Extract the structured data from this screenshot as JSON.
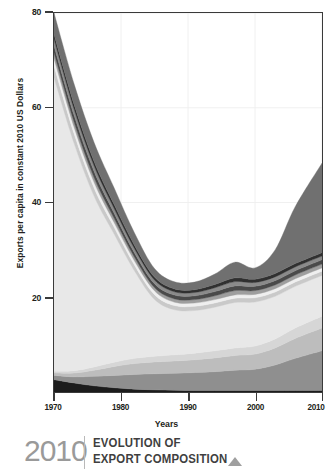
{
  "axes": {
    "y_title": "Exports per capita in constant 2010 US Dollars",
    "x_title": "Years",
    "y_ticks": [
      "80",
      "60",
      "40",
      "20"
    ],
    "x_ticks": [
      "1970",
      "1980",
      "1990",
      "2000",
      "2010"
    ]
  },
  "caption": {
    "year": "2010",
    "line1": "EVOLUTION OF",
    "line2": "EXPORT COMPOSITION",
    "marker": "triangle-up-icon"
  },
  "colors": {
    "frame": "#3a3a3a",
    "grid": "#f0f0f0",
    "text": "#231f20",
    "caption_year": "#9a9a9a",
    "caption_text": "#3f3f3f",
    "marker": "#9f9f9f"
  },
  "chart_data": {
    "type": "area",
    "stacked": true,
    "title": "",
    "xlabel": "Years",
    "ylabel": "Exports per capita in constant 2010 US Dollars",
    "xlim": [
      1970,
      2010
    ],
    "ylim": [
      0,
      80
    ],
    "yticks": [
      20,
      40,
      60,
      80
    ],
    "xticks": [
      1970,
      1980,
      1990,
      2000,
      2010
    ],
    "grid": true,
    "legend": "none",
    "x": [
      1970,
      1973,
      1976,
      1979,
      1982,
      1985,
      1988,
      1991,
      1994,
      1997,
      2000,
      2003,
      2006,
      2010
    ],
    "series": [
      {
        "name": "layer-1-bottom",
        "color": "#1c1c1c",
        "values": [
          2.6,
          1.9,
          1.3,
          0.9,
          0.6,
          0.45,
          0.35,
          0.3,
          0.3,
          0.3,
          0.3,
          0.3,
          0.3,
          0.3
        ]
      },
      {
        "name": "layer-2",
        "color": "#8f8f8f",
        "values": [
          0.9,
          1.3,
          2.0,
          2.6,
          3.1,
          3.4,
          3.6,
          3.8,
          4.0,
          4.3,
          4.5,
          5.4,
          6.8,
          8.4
        ]
      },
      {
        "name": "layer-3",
        "color": "#bdbdbd",
        "values": [
          0.5,
          0.8,
          1.3,
          1.9,
          2.3,
          2.5,
          2.6,
          2.7,
          2.9,
          3.1,
          3.2,
          3.6,
          4.2,
          4.8
        ]
      },
      {
        "name": "layer-4",
        "color": "#d6d6d6",
        "values": [
          0.4,
          0.5,
          0.7,
          0.9,
          1.1,
          1.2,
          1.3,
          1.4,
          1.5,
          1.6,
          1.7,
          1.9,
          2.2,
          2.5
        ]
      },
      {
        "name": "layer-5-dominant",
        "color": "#e8e8e8",
        "values": [
          62.0,
          48.0,
          36.0,
          27.0,
          18.5,
          12.0,
          9.5,
          9.0,
          9.2,
          9.6,
          9.3,
          9.0,
          8.8,
          8.6
        ]
      },
      {
        "name": "layer-6",
        "color": "#c9c9c9",
        "values": [
          2.4,
          2.0,
          1.7,
          1.4,
          1.2,
          1.0,
          0.9,
          0.9,
          0.9,
          0.9,
          0.9,
          0.9,
          0.9,
          0.9
        ]
      },
      {
        "name": "layer-7",
        "color": "#efefef",
        "values": [
          1.6,
          1.4,
          1.2,
          1.0,
          0.9,
          0.8,
          0.7,
          0.7,
          0.7,
          0.7,
          0.7,
          0.7,
          0.7,
          0.7
        ]
      },
      {
        "name": "layer-8",
        "color": "#9e9e9e",
        "values": [
          1.2,
          1.1,
          1.0,
          0.9,
          0.8,
          0.7,
          0.7,
          0.7,
          0.8,
          0.9,
          0.8,
          0.8,
          0.8,
          0.8
        ]
      },
      {
        "name": "layer-9",
        "color": "#4a4a4a",
        "values": [
          1.5,
          1.4,
          1.3,
          1.1,
          0.9,
          0.8,
          0.8,
          0.8,
          0.9,
          1.0,
          0.9,
          0.9,
          0.9,
          0.9
        ]
      },
      {
        "name": "layer-10",
        "color": "#8a8a8a",
        "values": [
          1.4,
          1.3,
          1.2,
          1.0,
          0.9,
          0.8,
          0.7,
          0.7,
          0.8,
          0.9,
          0.8,
          0.8,
          0.8,
          0.8
        ]
      },
      {
        "name": "layer-11",
        "color": "#303030",
        "values": [
          1.0,
          1.0,
          0.9,
          0.8,
          0.7,
          0.6,
          0.6,
          0.6,
          0.7,
          0.8,
          0.7,
          0.7,
          0.7,
          0.7
        ]
      },
      {
        "name": "layer-12-top",
        "color": "#707070",
        "values": [
          4.5,
          4.3,
          4.0,
          3.5,
          2.6,
          1.8,
          1.5,
          1.6,
          2.2,
          3.3,
          2.4,
          5.0,
          12.0,
          18.9
        ]
      }
    ],
    "totals": [
      80.0,
      65.0,
      52.6,
      43.0,
      33.6,
      26.05,
      23.25,
      23.2,
      24.9,
      27.4,
      26.2,
      29.95,
      40.1,
      48.2
    ]
  }
}
